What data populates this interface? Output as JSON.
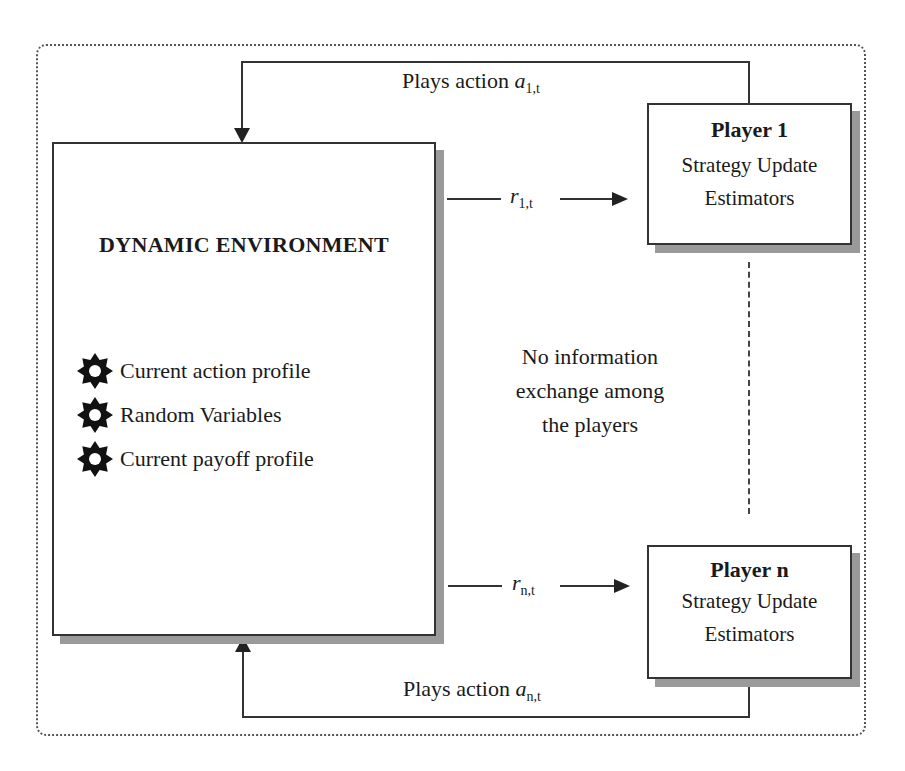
{
  "diagram": {
    "environment": {
      "title": "DYNAMIC ENVIRONMENT",
      "bullets": [
        {
          "icon": "gear-icon",
          "label": "Current action profile"
        },
        {
          "icon": "gear-icon",
          "label": "Random Variables"
        },
        {
          "icon": "gear-icon",
          "label": "Current payoff profile"
        }
      ]
    },
    "player1": {
      "title": "Player 1",
      "line1": "Strategy Update",
      "line2": "Estimators"
    },
    "playern": {
      "title": "Player n",
      "line1": "Strategy Update",
      "line2": "Estimators"
    },
    "edges": {
      "top_action_prefix": "Plays action",
      "top_action_var": "a",
      "top_action_sub": "1,t",
      "bottom_action_prefix": "Plays action",
      "bottom_action_var": "a",
      "bottom_action_sub": "n,t",
      "reward1_var": "r",
      "reward1_sub": "1,t",
      "rewardn_var": "r",
      "rewardn_sub": "n,t"
    },
    "note": {
      "line1": "No information",
      "line2": "exchange among",
      "line3": "the players"
    }
  }
}
